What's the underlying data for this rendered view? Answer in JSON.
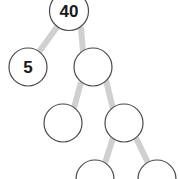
{
  "diagram": {
    "type": "binary-tree",
    "canvas": {
      "width": 178,
      "height": 179
    },
    "style": {
      "background_color": "#ffffff",
      "node_fill_color": "#ffffff",
      "node_stroke_color": "#4a4a4a",
      "node_stroke_width": 1.2,
      "edge_color": "#d0d0d0",
      "edge_width": 6,
      "label_color": "#1a1a1a",
      "label_font_size": 17
    },
    "nodes": [
      {
        "id": "n0",
        "label": "40",
        "cx": 69,
        "cy": 11,
        "r": 19.5,
        "level": 0,
        "empty": false,
        "clipped": "top"
      },
      {
        "id": "n1",
        "label": "5",
        "cx": 28,
        "cy": 67,
        "r": 19.0,
        "level": 1,
        "empty": false,
        "clipped": "none"
      },
      {
        "id": "n2",
        "label": "",
        "cx": 93,
        "cy": 67,
        "r": 19.0,
        "level": 1,
        "empty": true,
        "clipped": "none"
      },
      {
        "id": "n3",
        "label": "",
        "cx": 63,
        "cy": 123,
        "r": 19.0,
        "level": 2,
        "empty": true,
        "clipped": "none"
      },
      {
        "id": "n4",
        "label": "",
        "cx": 124,
        "cy": 123,
        "r": 19.0,
        "level": 2,
        "empty": true,
        "clipped": "none"
      },
      {
        "id": "n5",
        "label": "",
        "cx": 95,
        "cy": 179,
        "r": 19.0,
        "level": 3,
        "empty": true,
        "clipped": "bottom"
      },
      {
        "id": "n6",
        "label": "",
        "cx": 157,
        "cy": 179,
        "r": 19.0,
        "level": 3,
        "empty": true,
        "clipped": "bottom"
      }
    ],
    "edges": [
      {
        "id": "e0",
        "from": "n0",
        "to": "n1",
        "x1": 57,
        "y1": 27,
        "x2": 39,
        "y2": 52
      },
      {
        "id": "e1",
        "from": "n0",
        "to": "n2",
        "x1": 81,
        "y1": 27,
        "x2": 83,
        "y2": 52
      },
      {
        "id": "e2",
        "from": "n2",
        "to": "n3",
        "x1": 81,
        "y1": 82,
        "x2": 74,
        "y2": 108
      },
      {
        "id": "e3",
        "from": "n2",
        "to": "n4",
        "x1": 106,
        "y1": 80,
        "x2": 113,
        "y2": 109
      },
      {
        "id": "e4",
        "from": "n4",
        "to": "n5",
        "x1": 113,
        "y1": 138,
        "x2": 105,
        "y2": 163
      },
      {
        "id": "e5",
        "from": "n4",
        "to": "n6",
        "x1": 136,
        "y1": 138,
        "x2": 148,
        "y2": 163
      }
    ]
  }
}
